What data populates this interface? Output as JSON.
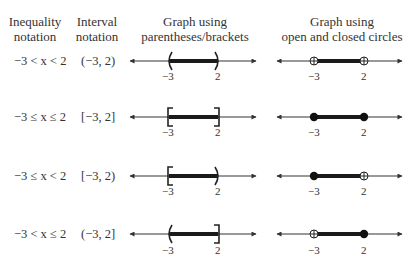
{
  "headers": {
    "inequality_line1": "Inequality",
    "inequality_line2": "notation",
    "interval_line1": "Interval",
    "interval_line2": "notation",
    "brackets_line1": "Graph using",
    "brackets_line2": "parentheses/brackets",
    "circles_line1": "Graph using",
    "circles_line2": "open and closed circles"
  },
  "rows": [
    {
      "inequality": "−3 < x < 2",
      "interval": "(−3, 2)",
      "left_label": "−3",
      "right_label": "2",
      "left_closed": false,
      "right_closed": false
    },
    {
      "inequality": "−3 ≤ x ≤ 2",
      "interval": "[−3, 2]",
      "left_label": "−3",
      "right_label": "2",
      "left_closed": true,
      "right_closed": true
    },
    {
      "inequality": "−3 ≤ x < 2",
      "interval": "[−3, 2)",
      "left_label": "−3",
      "right_label": "2",
      "left_closed": true,
      "right_closed": false
    },
    {
      "inequality": "−3 < x ≤ 2",
      "interval": "(−3, 2]",
      "left_label": "−3",
      "right_label": "2",
      "left_closed": false,
      "right_closed": true
    }
  ],
  "colors": {
    "line": "#333333",
    "segment": "#1a1a1a"
  }
}
